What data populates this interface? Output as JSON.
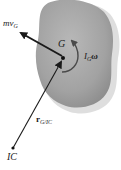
{
  "diagram": {
    "type": "rigid-body-kinetics",
    "body": {
      "fill_color": "#a8a8a8",
      "shadow_color": "#d4d4d4"
    },
    "points": [
      {
        "id": "G",
        "label": "G",
        "x": 63,
        "y": 58
      },
      {
        "id": "IC",
        "label": "IC",
        "x": 13,
        "y": 148
      }
    ],
    "vectors": [
      {
        "id": "linear-momentum",
        "label_main": "mv",
        "label_sub": "G",
        "from": "G",
        "direction": "up-left"
      },
      {
        "id": "position",
        "label_main": "r",
        "label_sub": "G/IC",
        "from": "IC",
        "to": "G"
      }
    ],
    "moments": [
      {
        "id": "angular-momentum",
        "label_main": "I",
        "label_sub": "G",
        "label_tail": "ω",
        "about": "G",
        "sense": "counterclockwise-arc"
      }
    ],
    "colors": {
      "line": "#1a1a1a",
      "body": "#a8a8a8",
      "text": "#1a1a1a"
    }
  }
}
